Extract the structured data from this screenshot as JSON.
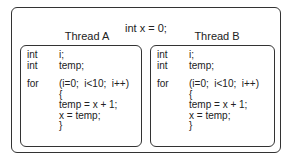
{
  "shared": {
    "declaration": "int x = 0;"
  },
  "threads": [
    {
      "title": "Thread A",
      "lines": [
        {
          "kw": "int",
          "text": "i;"
        },
        {
          "kw": "int",
          "text": "temp;"
        },
        {
          "kw": "for",
          "text": "(i=0;  i<10;  i++)"
        },
        {
          "kw": "",
          "text": "{"
        },
        {
          "kw": "",
          "text": "temp = x + 1;"
        },
        {
          "kw": "",
          "text": "x = temp;"
        },
        {
          "kw": "",
          "text": "}"
        }
      ]
    },
    {
      "title": "Thread B",
      "lines": [
        {
          "kw": "int",
          "text": "i;"
        },
        {
          "kw": "int",
          "text": "temp;"
        },
        {
          "kw": "for",
          "text": "(i=0;  i<10;  i++)"
        },
        {
          "kw": "",
          "text": "{"
        },
        {
          "kw": "",
          "text": "temp = x + 1;"
        },
        {
          "kw": "",
          "text": "x = temp;"
        },
        {
          "kw": "",
          "text": "}"
        }
      ]
    }
  ]
}
